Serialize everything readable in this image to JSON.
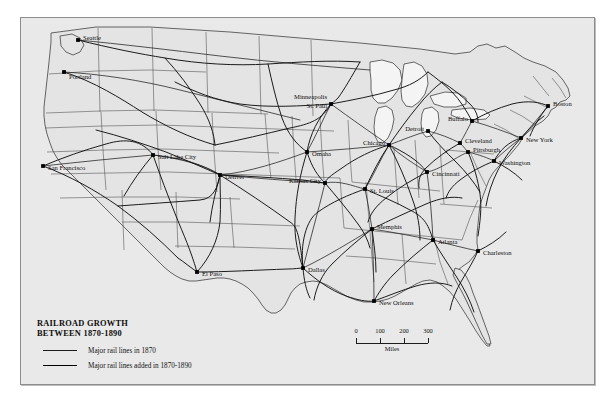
{
  "figure": {
    "kind": "historical-thematic-map",
    "region": "United States"
  },
  "legend": {
    "title_line1": "RAILROAD GROWTH",
    "title_line2": "BETWEEN 1870-1890",
    "entries": [
      {
        "label": "Major rail lines in 1870",
        "style": "thin"
      },
      {
        "label": "Major rail lines added in 1870-1890",
        "style": "thick"
      }
    ]
  },
  "scale": {
    "ticks": [
      "0",
      "100",
      "200",
      "300"
    ],
    "unit": "Miles"
  },
  "cities": [
    {
      "name": "Seattle",
      "dot_x": 78,
      "dot_y": 40,
      "label_x": 83,
      "label_y": 38,
      "anchor": "start"
    },
    {
      "name": "Portland",
      "dot_x": 64,
      "dot_y": 72,
      "label_x": 69,
      "label_y": 77,
      "anchor": "start"
    },
    {
      "name": "San Francisco",
      "dot_x": 43,
      "dot_y": 166,
      "label_x": 48,
      "label_y": 168,
      "anchor": "start"
    },
    {
      "name": "Salt Lake City",
      "dot_x": 153,
      "dot_y": 155,
      "label_x": 158,
      "label_y": 157,
      "anchor": "start"
    },
    {
      "name": "Denver",
      "dot_x": 220,
      "dot_y": 175,
      "label_x": 225,
      "label_y": 177,
      "anchor": "start"
    },
    {
      "name": "El Paso",
      "dot_x": 197,
      "dot_y": 272,
      "label_x": 202,
      "label_y": 274,
      "anchor": "start"
    },
    {
      "name": "Dallas",
      "dot_x": 303,
      "dot_y": 268,
      "label_x": 308,
      "label_y": 270,
      "anchor": "start"
    },
    {
      "name": "Kansas City",
      "dot_x": 325,
      "dot_y": 183,
      "label_x": 321,
      "label_y": 181,
      "anchor": "end"
    },
    {
      "name": "Omaha",
      "dot_x": 307,
      "dot_y": 152,
      "label_x": 312,
      "label_y": 154,
      "anchor": "start"
    },
    {
      "name": "Minneapolis",
      "dot_x": 331,
      "dot_y": 104,
      "label_x": 327,
      "label_y": 97,
      "anchor": "end"
    },
    {
      "name": "St. Paul",
      "dot_x": 331,
      "dot_y": 104,
      "label_x": 327,
      "label_y": 106,
      "anchor": "end"
    },
    {
      "name": "Chicago",
      "dot_x": 389,
      "dot_y": 145,
      "label_x": 385,
      "label_y": 143,
      "anchor": "end"
    },
    {
      "name": "St. Louis",
      "dot_x": 365,
      "dot_y": 189,
      "label_x": 370,
      "label_y": 191,
      "anchor": "start"
    },
    {
      "name": "Memphis",
      "dot_x": 372,
      "dot_y": 229,
      "label_x": 377,
      "label_y": 227,
      "anchor": "start"
    },
    {
      "name": "New Orleans",
      "dot_x": 374,
      "dot_y": 301,
      "label_x": 379,
      "label_y": 303,
      "anchor": "start"
    },
    {
      "name": "Atlanta",
      "dot_x": 433,
      "dot_y": 240,
      "label_x": 438,
      "label_y": 242,
      "anchor": "start"
    },
    {
      "name": "Charleston",
      "dot_x": 478,
      "dot_y": 251,
      "label_x": 483,
      "label_y": 253,
      "anchor": "start"
    },
    {
      "name": "Cincinnati",
      "dot_x": 427,
      "dot_y": 172,
      "label_x": 432,
      "label_y": 174,
      "anchor": "start"
    },
    {
      "name": "Detroit",
      "dot_x": 428,
      "dot_y": 131,
      "label_x": 424,
      "label_y": 129,
      "anchor": "end"
    },
    {
      "name": "Cleveland",
      "dot_x": 460,
      "dot_y": 143,
      "label_x": 465,
      "label_y": 141,
      "anchor": "start"
    },
    {
      "name": "Pittsburgh",
      "dot_x": 468,
      "dot_y": 152,
      "label_x": 473,
      "label_y": 150,
      "anchor": "start"
    },
    {
      "name": "Buffalo",
      "dot_x": 472,
      "dot_y": 121,
      "label_x": 468,
      "label_y": 119,
      "anchor": "end"
    },
    {
      "name": "Washington",
      "dot_x": 494,
      "dot_y": 161,
      "label_x": 499,
      "label_y": 163,
      "anchor": "start"
    },
    {
      "name": "New York",
      "dot_x": 521,
      "dot_y": 138,
      "label_x": 526,
      "label_y": 140,
      "anchor": "start"
    },
    {
      "name": "Boston",
      "dot_x": 548,
      "dot_y": 106,
      "label_x": 553,
      "label_y": 104,
      "anchor": "start"
    }
  ],
  "colors": {
    "page_background": "#ffffff",
    "map_field": "#e9e9e9",
    "land": "#e4e4e4",
    "lake": "#f4f4f4",
    "outline": "#2b2b2b",
    "rail": "#111111",
    "frame_border": "#8d8d8d"
  }
}
